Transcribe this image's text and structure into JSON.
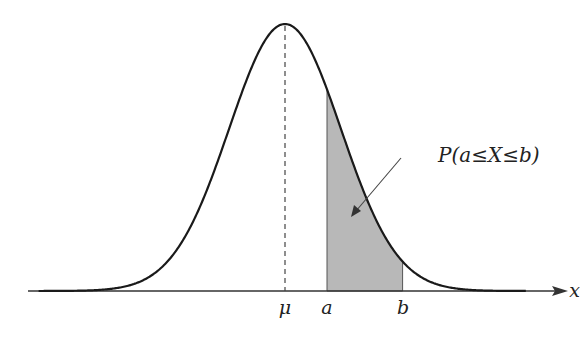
{
  "diagram": {
    "axis_label": "x",
    "tick_labels": {
      "mean": "μ",
      "lower": "a",
      "upper": "b"
    },
    "annotation": "P(a≤X≤b)",
    "distribution": {
      "type": "normal",
      "mean": 0,
      "std": 1,
      "a": 0.75,
      "b": 2.1,
      "x_range": [
        -4.4,
        4.3
      ]
    },
    "colors": {
      "curve": "#1a1a1a",
      "shade": "#b8b8b8",
      "axis": "#333333"
    }
  }
}
